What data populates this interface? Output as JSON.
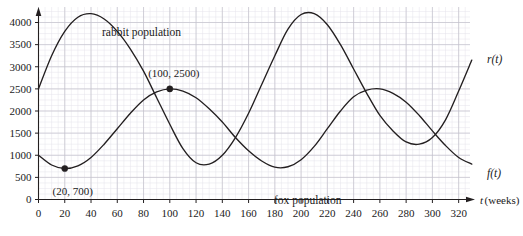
{
  "chart_data": {
    "type": "line",
    "title": "",
    "xlabel": "t (weeks)",
    "ylabel": "",
    "xlim": [
      0,
      330
    ],
    "ylim": [
      0,
      4400
    ],
    "grid": true,
    "legend": "inline-labels",
    "x_ticks": [
      0,
      20,
      40,
      60,
      80,
      100,
      120,
      140,
      160,
      180,
      200,
      220,
      240,
      260,
      280,
      300,
      320
    ],
    "y_ticks": [
      0,
      500,
      1000,
      1500,
      2000,
      2500,
      3000,
      3500,
      4000
    ],
    "x_tick_labels": [
      "0",
      "20",
      "40",
      "60",
      "80",
      "100",
      "120",
      "140",
      "160",
      "180",
      "200",
      "220",
      "240",
      "260",
      "280",
      "300",
      "320"
    ],
    "y_tick_labels": [
      "0",
      "500",
      "1000",
      "1500",
      "2000",
      "2500",
      "3000",
      "3500",
      "4000"
    ],
    "series": [
      {
        "name": "rabbit population",
        "symbol": "r(t)",
        "color": "#231f20",
        "x": [
          0,
          10,
          20,
          30,
          40,
          50,
          60,
          70,
          80,
          90,
          100,
          110,
          120,
          130,
          140,
          150,
          160,
          170,
          180,
          190,
          200,
          210,
          220,
          230,
          240,
          250,
          260,
          270,
          280,
          290,
          300,
          310,
          320,
          330
        ],
        "y": [
          2500,
          3250,
          3800,
          4120,
          4200,
          4080,
          3800,
          3400,
          2900,
          2300,
          1700,
          1150,
          830,
          800,
          1000,
          1400,
          1950,
          2600,
          3250,
          3850,
          4180,
          4200,
          3950,
          3500,
          2950,
          2400,
          1900,
          1550,
          1300,
          1250,
          1400,
          1800,
          2450,
          3150
        ],
        "annotations": []
      },
      {
        "name": "fox population",
        "symbol": "f(t)",
        "color": "#231f20",
        "x": [
          0,
          10,
          20,
          30,
          40,
          50,
          60,
          70,
          80,
          90,
          100,
          110,
          120,
          130,
          140,
          150,
          160,
          170,
          180,
          190,
          200,
          210,
          220,
          230,
          240,
          250,
          260,
          270,
          280,
          290,
          300,
          310,
          320,
          330
        ],
        "y": [
          1000,
          780,
          700,
          760,
          950,
          1250,
          1600,
          1950,
          2250,
          2430,
          2500,
          2450,
          2300,
          2050,
          1750,
          1400,
          1100,
          870,
          730,
          740,
          900,
          1200,
          1600,
          2000,
          2320,
          2470,
          2500,
          2400,
          2200,
          1900,
          1550,
          1220,
          950,
          800
        ]
      }
    ],
    "annotations": [
      {
        "label": "(20, 700)",
        "x": 20,
        "y": 700,
        "marker": true,
        "text_dx": 8,
        "text_dy": 26
      },
      {
        "label": "(100, 2500)",
        "x": 100,
        "y": 2500,
        "marker": true,
        "text_dx": 4,
        "text_dy": -12
      }
    ],
    "series_captions": [
      {
        "text": "rabbit population",
        "x": 102,
        "y": 36
      },
      {
        "text": "fox population",
        "x": 274,
        "y": 204
      }
    ],
    "series_symbols": [
      {
        "text": "r(t)",
        "x": 487,
        "y": 63
      },
      {
        "text": "f(t)",
        "x": 487,
        "y": 177
      }
    ]
  },
  "axes": {
    "x_caption_t": "t",
    "x_caption_units": "(weeks)"
  }
}
